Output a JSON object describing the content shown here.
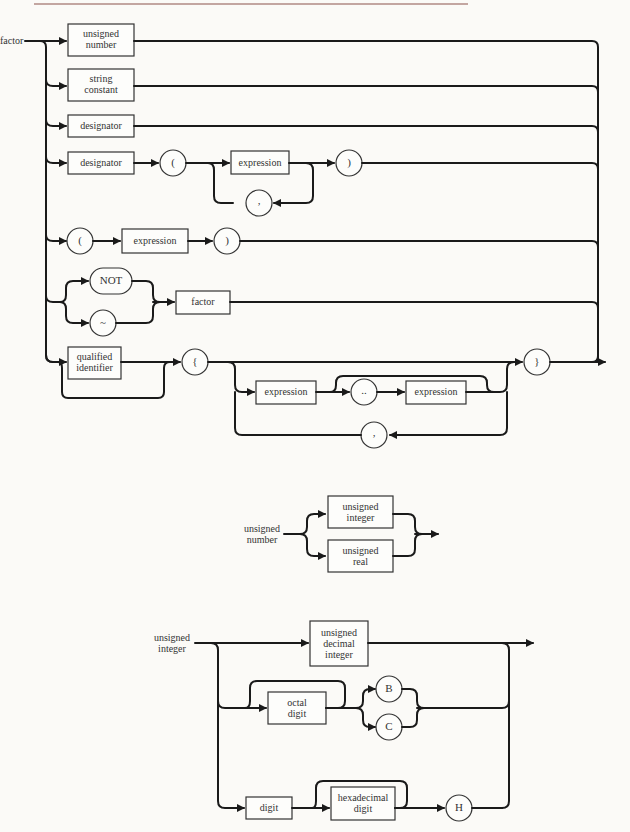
{
  "page": {
    "type": "syntax-diagram"
  },
  "factor_diagram": {
    "name": "factor",
    "nonterminals": {
      "unsigned_number": "unsigned number",
      "unsigned_number_l1": "unsigned",
      "unsigned_number_l2": "number",
      "string_constant_l1": "string",
      "string_constant_l2": "constant",
      "designator_1": "designator",
      "designator_2": "designator",
      "expression_1": "expression",
      "expression_2": "expression",
      "factor": "factor",
      "qualified_identifier_l1": "qualified",
      "qualified_identifier_l2": "identifier",
      "expression_3": "expression",
      "expression_4": "expression"
    },
    "terminals": {
      "lparen_1": "(",
      "rparen_1": ")",
      "comma_1": ",",
      "lparen_2": "(",
      "rparen_2": ")",
      "not": "NOT",
      "tilde": "~",
      "lbrace": "{",
      "range": "..",
      "comma_2": ",",
      "rbrace": "}"
    }
  },
  "unsigned_number_diagram": {
    "name_l1": "unsigned",
    "name_l2": "number",
    "nonterminals": {
      "unsigned_integer_l1": "unsigned",
      "unsigned_integer_l2": "integer",
      "unsigned_real_l1": "unsigned",
      "unsigned_real_l2": "real"
    }
  },
  "unsigned_integer_diagram": {
    "name_l1": "unsigned",
    "name_l2": "integer",
    "nonterminals": {
      "unsigned_decimal_integer_l1": "unsigned",
      "unsigned_decimal_integer_l2": "decimal",
      "unsigned_decimal_integer_l3": "integer",
      "octal_digit_l1": "octal",
      "octal_digit_l2": "digit",
      "digit": "digit",
      "hexadecimal_digit_l1": "hexadecimal",
      "hexadecimal_digit_l2": "digit"
    },
    "terminals": {
      "B": "B",
      "C": "C",
      "H": "H"
    }
  }
}
